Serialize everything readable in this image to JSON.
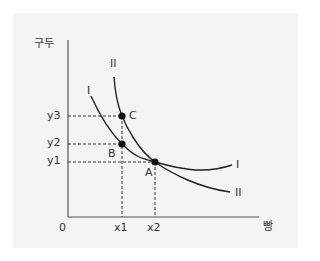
{
  "diagram": {
    "y_axis_label": "구두",
    "x_axis_label": "빵",
    "origin_label": "0",
    "x_ticks": [
      "x1",
      "x2"
    ],
    "y_ticks": [
      "y3",
      "y2",
      "y1"
    ],
    "curves": [
      {
        "name": "I",
        "label": "I"
      },
      {
        "name": "II",
        "label": "II"
      }
    ],
    "points": [
      {
        "name": "A",
        "label": "A"
      },
      {
        "name": "B",
        "label": "B"
      },
      {
        "name": "C",
        "label": "C"
      }
    ],
    "colors": {
      "panel": "#f4f4f4",
      "line": "#222222",
      "text": "#333333"
    }
  }
}
